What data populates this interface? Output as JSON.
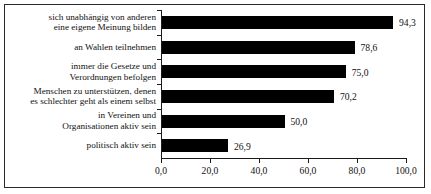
{
  "chart_data": {
    "type": "bar",
    "orientation": "horizontal",
    "title": "",
    "subtitle": "",
    "xlabel": "",
    "ylabel": "",
    "xlim": [
      0.0,
      100.0
    ],
    "grid": false,
    "legend": false,
    "decimal_separator": ",",
    "categories": [
      "sich unabhängig von anderen\neine eigene Meinung bilden",
      "an Wahlen teilnehmen",
      "immer die Gesetze und\nVerordnungen befolgen",
      "Menschen zu unterstützen, denen\nes schlechter geht als einem selbst",
      "in Vereinen und\nOrganisationen aktiv sein",
      "politisch aktiv sein"
    ],
    "values": [
      94.3,
      78.6,
      75.0,
      70.2,
      50.0,
      26.9
    ],
    "value_labels": [
      "94,3",
      "78,6",
      "75,0",
      "70,2",
      "50,0",
      "26,9"
    ],
    "x_ticks": [
      0.0,
      20.0,
      40.0,
      60.0,
      80.0,
      100.0
    ],
    "x_tick_labels": [
      "0,0",
      "20,0",
      "40,0",
      "60,0",
      "80,0",
      "100,0"
    ],
    "colors": {
      "bar": "#000000",
      "axis": "#1a1a1a",
      "text": "#111111",
      "background": "#ffffff",
      "frame": "#2a2a2a"
    }
  }
}
